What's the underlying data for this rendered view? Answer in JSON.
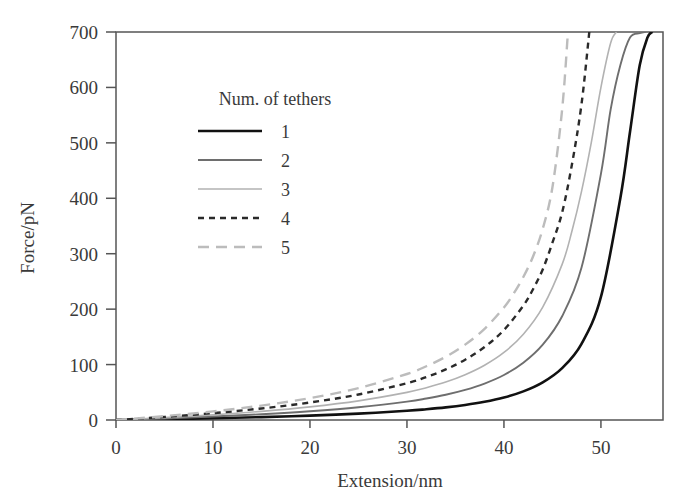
{
  "chart_data": {
    "type": "line",
    "title": "",
    "xlabel": "Extension/nm",
    "ylabel": "Force/pN",
    "xlim": [
      0,
      56.4
    ],
    "ylim": [
      0,
      700
    ],
    "xticks": [
      0,
      10,
      20,
      30,
      40,
      50
    ],
    "yticks": [
      0,
      100,
      200,
      300,
      400,
      500,
      600,
      700
    ],
    "xtick_labels": [
      "0",
      "10",
      "20",
      "30",
      "40",
      "50"
    ],
    "ytick_labels": [
      "0",
      "100",
      "200",
      "300",
      "400",
      "500",
      "600",
      "700"
    ],
    "grid": false,
    "legend_position": "upper-center-left",
    "legend_title": "Num. of tethers",
    "model": "worm-like-chain parallel tethers",
    "contour_length_nm": 55.8,
    "persistence_length_nm": 0.4,
    "series": [
      {
        "name": "1",
        "label": "1",
        "tethers": 1,
        "color": "#111111",
        "width": 2.6,
        "dash": "none",
        "x": [
          0,
          5,
          10,
          15,
          20,
          25,
          30,
          32,
          34,
          36,
          38,
          40,
          42,
          44,
          46,
          48,
          50,
          52,
          53,
          54,
          54.8,
          55.3
        ],
        "y": [
          0,
          1.4,
          3.1,
          5.2,
          7.9,
          11.5,
          16.6,
          19.4,
          22.8,
          27.2,
          32.9,
          40.6,
          51.6,
          67.9,
          93.6,
          137.5,
          222.0,
          400.0,
          520.0,
          640.0,
          690.0,
          700
        ]
      },
      {
        "name": "2",
        "label": "2",
        "tethers": 2,
        "color": "#6e6e6e",
        "width": 1.9,
        "dash": "none",
        "x": [
          0,
          5,
          10,
          15,
          20,
          25,
          30,
          32,
          34,
          36,
          38,
          40,
          42,
          44,
          46,
          48,
          50,
          51,
          52,
          53,
          54,
          54.6
        ],
        "y": [
          0,
          2.8,
          6.2,
          10.4,
          15.8,
          23.0,
          33.2,
          38.8,
          45.6,
          54.4,
          65.8,
          81.2,
          103.2,
          135.8,
          187.2,
          275.0,
          444.0,
          560.0,
          640.0,
          690.0,
          698.0,
          700
        ]
      },
      {
        "name": "3",
        "label": "3",
        "tethers": 3,
        "color": "#b2b2b2",
        "width": 1.6,
        "dash": "none",
        "x": [
          0,
          5,
          10,
          15,
          20,
          25,
          30,
          32,
          34,
          36,
          38,
          40,
          42,
          44,
          46,
          47,
          48,
          49,
          50,
          51,
          51.6
        ],
        "y": [
          0,
          4.2,
          9.3,
          15.6,
          23.7,
          34.5,
          49.8,
          58.2,
          68.4,
          81.6,
          98.7,
          121.8,
          154.8,
          203.7,
          280.8,
          340.0,
          412.5,
          500.0,
          600.0,
          680.0,
          700
        ]
      },
      {
        "name": "4",
        "label": "4",
        "tethers": 4,
        "color": "#2a2a2a",
        "width": 2.4,
        "dash": "6,5",
        "x": [
          0,
          5,
          10,
          15,
          20,
          25,
          30,
          32,
          34,
          36,
          38,
          40,
          42,
          43,
          44,
          45,
          46,
          47,
          48,
          48.8
        ],
        "y": [
          0,
          5.6,
          12.4,
          20.8,
          31.6,
          46.0,
          66.4,
          77.6,
          91.2,
          108.8,
          131.6,
          162.4,
          206.4,
          236.0,
          271.6,
          320.0,
          374.4,
          460.0,
          570.0,
          700
        ]
      },
      {
        "name": "5",
        "label": "5",
        "tethers": 5,
        "color": "#bcbcbc",
        "width": 2.4,
        "dash": "11,7",
        "x": [
          0,
          5,
          10,
          15,
          20,
          25,
          30,
          32,
          34,
          36,
          38,
          40,
          41,
          42,
          43,
          44,
          45,
          46,
          46.6
        ],
        "y": [
          0,
          7.0,
          15.5,
          26.0,
          39.5,
          57.5,
          83.0,
          97.0,
          114.0,
          136.0,
          164.5,
          203.0,
          228.0,
          258.0,
          295.0,
          345.0,
          420.0,
          560.0,
          700
        ]
      }
    ]
  },
  "axes": {
    "x_title": "Extension/nm",
    "y_title": "Force/pN"
  },
  "legend": {
    "title": "Num. of tethers",
    "entries": [
      {
        "label": "1"
      },
      {
        "label": "2"
      },
      {
        "label": "3"
      },
      {
        "label": "4"
      },
      {
        "label": "5"
      }
    ]
  },
  "style": {
    "background": "#ffffff",
    "frame_color": "#555555",
    "text_color": "#3a3a3a"
  }
}
